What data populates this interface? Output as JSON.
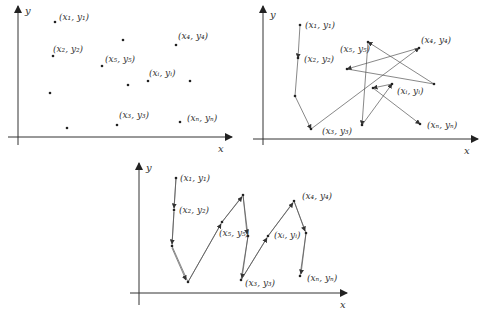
{
  "axis_labels": {
    "x": "x",
    "y": "y"
  },
  "labels": {
    "p1": "(x₁, y₁)",
    "p2": "(x₂, y₂)",
    "p3": "(x₃, y₃)",
    "p4": "(x₄, y₄)",
    "p5": "(x₅, y₅)",
    "pi": "(xᵢ, yᵢ)",
    "pN": "(xₙ, yₙ)"
  },
  "panels": [
    {
      "name": "scattered-points",
      "description": "Unordered set of points"
    },
    {
      "name": "random-order-path",
      "description": "Points connected in arbitrary order"
    },
    {
      "name": "sorted-by-x-path",
      "description": "Points connected in order of x"
    }
  ]
}
